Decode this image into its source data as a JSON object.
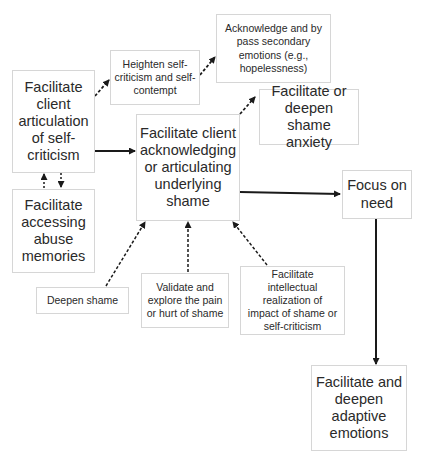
{
  "diagram": {
    "nodes": {
      "articulation": {
        "label": "Facilitate client articulation of self-criticism"
      },
      "heighten": {
        "label": "Heighten self-criticism and self-contempt"
      },
      "acknowledge_secondary": {
        "label": "Acknowledge and by pass secondary emotions (e.g., hopelessness)"
      },
      "shame_anxiety": {
        "label": "Facilitate or deepen shame anxiety"
      },
      "underlying_shame": {
        "label": "Facilitate client acknowledging or articulating underlying shame"
      },
      "abuse_memories": {
        "label": "Facilitate accessing abuse memories"
      },
      "focus_need": {
        "label": "Focus on need"
      },
      "deepen_shame": {
        "label": "Deepen shame"
      },
      "validate": {
        "label": "Validate and explore the pain or hurt of shame"
      },
      "intellectual": {
        "label": "Facilitate intellectual realization of impact of shame or self-criticism"
      },
      "adaptive": {
        "label": "Facilitate and deepen adaptive emotions"
      }
    },
    "edges": [
      {
        "from": "articulation",
        "to": "heighten",
        "style": "dashed"
      },
      {
        "from": "heighten",
        "to": "acknowledge_secondary",
        "style": "dashed"
      },
      {
        "from": "articulation",
        "to": "underlying_shame",
        "style": "solid"
      },
      {
        "from": "articulation",
        "to": "abuse_memories",
        "style": "dashed"
      },
      {
        "from": "abuse_memories",
        "to": "articulation",
        "style": "dashed"
      },
      {
        "from": "underlying_shame",
        "to": "shame_anxiety",
        "style": "dashed"
      },
      {
        "from": "underlying_shame",
        "to": "focus_need",
        "style": "solid"
      },
      {
        "from": "deepen_shame",
        "to": "underlying_shame",
        "style": "dashed"
      },
      {
        "from": "validate",
        "to": "underlying_shame",
        "style": "dashed"
      },
      {
        "from": "intellectual",
        "to": "underlying_shame",
        "style": "dashed"
      },
      {
        "from": "focus_need",
        "to": "adaptive",
        "style": "solid"
      }
    ],
    "colors": {
      "box_border": "#d6d6d6",
      "arrow": "#1a1a1a",
      "text": "#2a2a2a"
    }
  }
}
